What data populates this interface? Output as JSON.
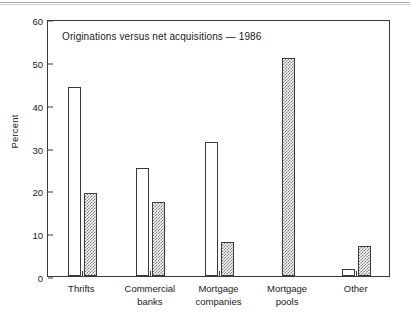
{
  "chart_data": {
    "type": "bar",
    "title": "Originations versus net acquisitions — 1986",
    "xlabel": "",
    "ylabel": "Percent",
    "ylim": [
      0,
      60
    ],
    "yticks": [
      0,
      10,
      20,
      30,
      40,
      50,
      60
    ],
    "ytick_labels": [
      "0",
      "10",
      "20",
      "30",
      "40",
      "50",
      "60"
    ],
    "grid": false,
    "legend": "none",
    "categories": [
      "Thrifts",
      "Commercial banks",
      "Mortgage companies",
      "Mortgage pools",
      "Other"
    ],
    "category_lines": [
      [
        "Thrifts",
        ""
      ],
      [
        "Commercial",
        "banks"
      ],
      [
        "Mortgage",
        "companies"
      ],
      [
        "Mortgage",
        "pools"
      ],
      [
        "Other",
        ""
      ]
    ],
    "series": [
      {
        "name": "Originations",
        "style": "open",
        "values": [
          44.1,
          25.2,
          31.2,
          0,
          1.6
        ]
      },
      {
        "name": "Net acquisitions",
        "style": "hatched",
        "values": [
          19.4,
          17.3,
          8.0,
          50.8,
          6.9
        ]
      }
    ]
  },
  "colors": {
    "axis": "#3a3a3a",
    "text": "#1a1a1a",
    "open_bar_fill": "#ffffff",
    "hatched_bar_fill": "#7d7d7d",
    "background": "#ffffff"
  }
}
